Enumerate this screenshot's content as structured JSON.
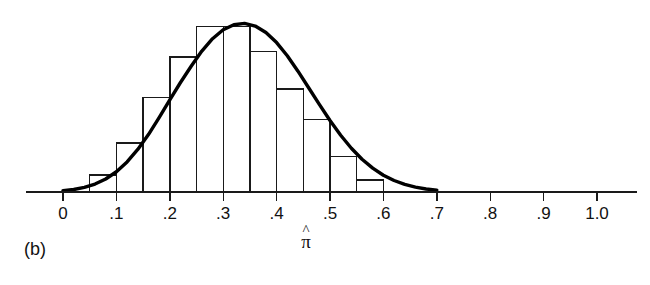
{
  "figure": {
    "panel_label": "(b)",
    "axis_title": "π",
    "axis_title_accent": "^",
    "background_color": "#ffffff",
    "ink_color": "#1a1a1a"
  },
  "chart_data": {
    "type": "bar",
    "title": "",
    "subtitle": "",
    "xlabel": "π̂",
    "ylabel": "",
    "grid": false,
    "legend": null,
    "xlim": [
      -0.02,
      1.06
    ],
    "ylim": [
      0,
      1.0
    ],
    "xtick_values": [
      0,
      0.1,
      0.2,
      0.3,
      0.4,
      0.5,
      0.6,
      0.7,
      0.8,
      0.9,
      1.0
    ],
    "xtick_labels": [
      "0",
      ".1",
      ".2",
      ".3",
      ".4",
      ".5",
      ".6",
      ".7",
      ".8",
      ".9",
      "1.0"
    ],
    "ytick_values": [],
    "ytick_labels": [],
    "bin_width": 0.05,
    "bin_edges": [
      0.05,
      0.1,
      0.15,
      0.2,
      0.25,
      0.3,
      0.35,
      0.4,
      0.45,
      0.5,
      0.55,
      0.6
    ],
    "bin_centers": [
      0.075,
      0.125,
      0.175,
      0.225,
      0.275,
      0.325,
      0.375,
      0.425,
      0.475,
      0.525,
      0.575
    ],
    "categories": [
      "0.05-0.10",
      "0.10-0.15",
      "0.15-0.20",
      "0.20-0.25",
      "0.25-0.30",
      "0.30-0.35",
      "0.35-0.40",
      "0.40-0.45",
      "0.45-0.50",
      "0.50-0.55",
      "0.55-0.60"
    ],
    "values": [
      0.1,
      0.29,
      0.56,
      0.8,
      0.98,
      0.98,
      0.83,
      0.61,
      0.43,
      0.21,
      0.07
    ],
    "series": [
      {
        "name": "histogram",
        "values": [
          0.1,
          0.29,
          0.56,
          0.8,
          0.98,
          0.98,
          0.83,
          0.61,
          0.43,
          0.21,
          0.07
        ]
      },
      {
        "name": "normal-curve",
        "mean": 0.3,
        "sd": 0.093,
        "peak": 1.0,
        "x": [
          0.0,
          0.02,
          0.04,
          0.06,
          0.08,
          0.1,
          0.12,
          0.14,
          0.16,
          0.18,
          0.2,
          0.22,
          0.24,
          0.26,
          0.28,
          0.3,
          0.32,
          0.34,
          0.36,
          0.38,
          0.4,
          0.42,
          0.44,
          0.46,
          0.48,
          0.5,
          0.52,
          0.54,
          0.56,
          0.58,
          0.6,
          0.62,
          0.64,
          0.66,
          0.68,
          0.7
        ],
        "y": [
          0.008,
          0.015,
          0.027,
          0.047,
          0.077,
          0.12,
          0.178,
          0.252,
          0.34,
          0.44,
          0.545,
          0.648,
          0.744,
          0.834,
          0.907,
          0.96,
          0.99,
          0.998,
          0.982,
          0.944,
          0.884,
          0.806,
          0.715,
          0.617,
          0.518,
          0.423,
          0.336,
          0.259,
          0.194,
          0.141,
          0.099,
          0.068,
          0.045,
          0.029,
          0.018,
          0.011
        ]
      }
    ]
  }
}
